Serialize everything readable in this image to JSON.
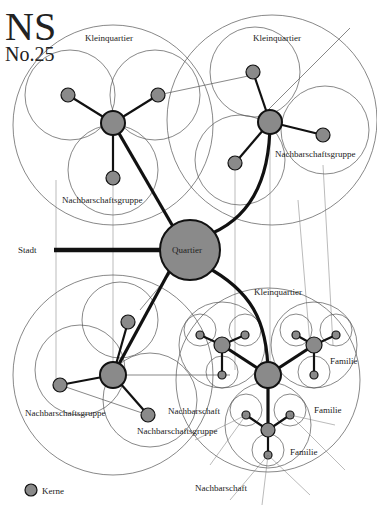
{
  "title": {
    "main": "NS",
    "sub": "No.25"
  },
  "labels": {
    "kleinquartier_top_left": "Kleinquartier",
    "kleinquartier_top_right": "Kleinquartier",
    "kleinquartier_bottom_right": "Kleinquartier",
    "nbg_top_left": "Nachbarschaftsgruppe",
    "nbg_top_right": "Nachbarschaftsgruppe",
    "nbg_bottom_left": "Nachbarschaftsgruppe",
    "nbg_bottom_mid": "Nachbarschaftsgruppe",
    "nachbarschaft_mid": "Nachbarschaft",
    "nachbarschaft_bottom": "Nachbarschaft",
    "familie_1": "Familie",
    "familie_2": "Familie",
    "familie_3": "Familie",
    "stadt": "Stadt",
    "quartier": "Quartier"
  },
  "legend": {
    "label": "Kerne",
    "icon": "kern-node-icon"
  },
  "colors": {
    "node_fill": "#8a8a8a",
    "line": "#111111",
    "circle": "#555555"
  }
}
